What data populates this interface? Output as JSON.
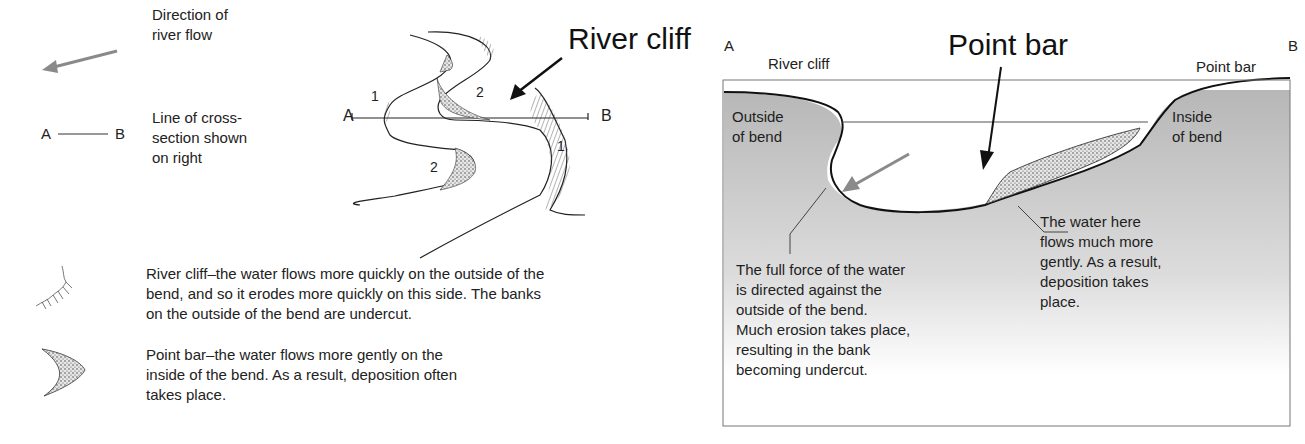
{
  "legend": {
    "flow": {
      "icon": "grey-arrow-left-icon",
      "text_line1": "Direction of",
      "text_line2": "river flow"
    },
    "section_line": {
      "a": "A",
      "b": "B",
      "text_line1": "Line of cross-",
      "text_line2": "section shown",
      "text_line3": "on right"
    }
  },
  "map": {
    "title": "River cliff",
    "a": "A",
    "b": "B",
    "numbers": {
      "n1_left": "1",
      "n2_top": "2",
      "n2_bottom": "2",
      "n1_right": "1"
    }
  },
  "key": {
    "river_cliff": {
      "line1": "River cliff–the water flows more quickly on the outside of the",
      "line2": "bend, and so it erodes more quickly on this side. The banks",
      "line3": "on the outside of the bend are undercut."
    },
    "point_bar": {
      "line1": "Point bar–the water flows more gently on the",
      "line2": "inside of the bend. As a result, deposition often",
      "line3": "takes place."
    }
  },
  "cross_section": {
    "title": "Point bar",
    "a": "A",
    "b": "B",
    "river_cliff_label": "River cliff",
    "point_bar_label": "Point bar",
    "outside": {
      "line1": "Outside",
      "line2": "of bend"
    },
    "inside": {
      "line1": "Inside",
      "line2": "of bend"
    },
    "left_note": [
      "The full force of the water",
      "is directed against the",
      "outside of the bend.",
      "Much erosion takes place,",
      "resulting in the bank",
      "becoming undercut."
    ],
    "right_note": [
      "The water here",
      "flows much more",
      "gently. As a result,",
      "deposition takes",
      "place."
    ],
    "colors": {
      "bank_top": "#b9b9b9",
      "bank_bottom": "#ffffff",
      "arrow": "#8a8a8a",
      "outline": "#111111"
    }
  }
}
